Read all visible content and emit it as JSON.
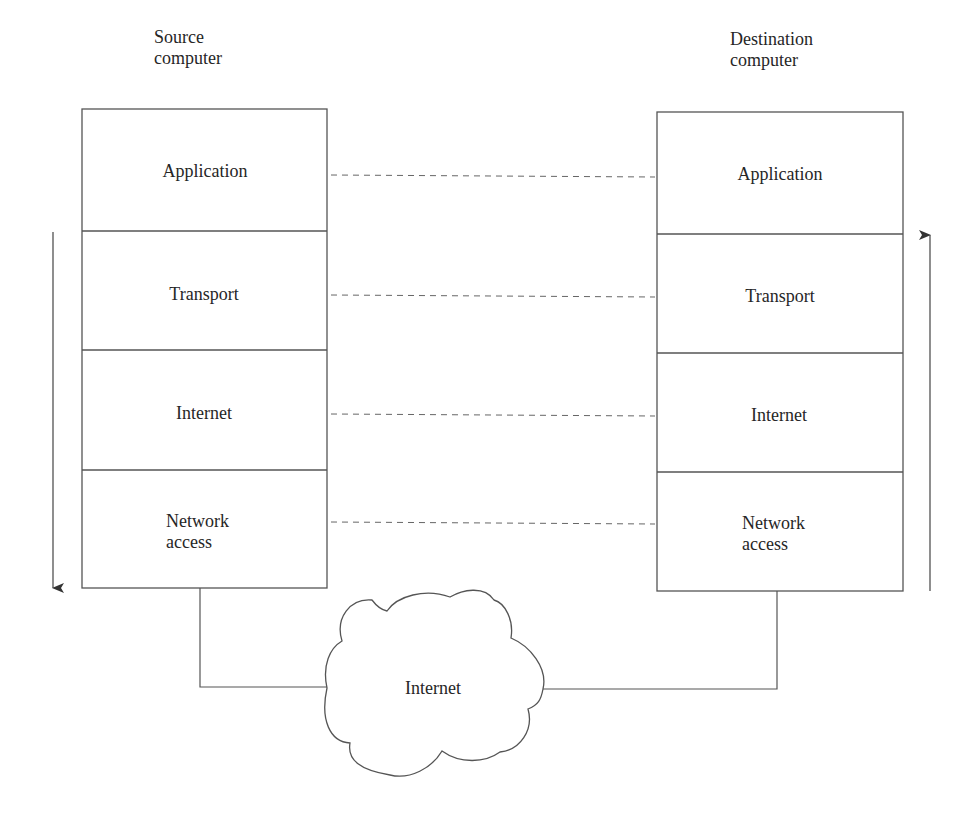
{
  "source": {
    "title_line1": "Source",
    "title_line2": "computer",
    "layers": [
      {
        "label_line1": "Application",
        "label_line2": ""
      },
      {
        "label_line1": "Transport",
        "label_line2": ""
      },
      {
        "label_line1": "Internet",
        "label_line2": ""
      },
      {
        "label_line1": "Network",
        "label_line2": "access"
      }
    ],
    "flow_direction": "down"
  },
  "destination": {
    "title_line1": "Destination",
    "title_line2": "computer",
    "layers": [
      {
        "label_line1": "Application",
        "label_line2": ""
      },
      {
        "label_line1": "Transport",
        "label_line2": ""
      },
      {
        "label_line1": "Internet",
        "label_line2": ""
      },
      {
        "label_line1": "Network",
        "label_line2": "access"
      }
    ],
    "flow_direction": "up"
  },
  "network": {
    "label": "Internet",
    "shape": "cloud"
  },
  "peer_links": [
    "Application",
    "Transport",
    "Internet",
    "Network access"
  ],
  "colors": {
    "stroke": "#555555",
    "text": "#262626",
    "background": "#ffffff"
  }
}
